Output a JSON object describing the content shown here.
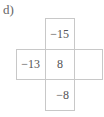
{
  "label": "d)",
  "grid": {
    "top": "−15",
    "left": "−13",
    "center": "8",
    "right": "",
    "bottom": "−8"
  },
  "colors": {
    "border": "#c8c8c8",
    "text": "#555555"
  }
}
